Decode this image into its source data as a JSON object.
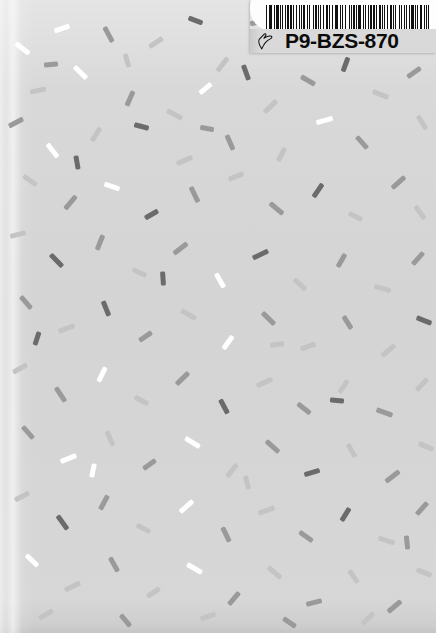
{
  "scene": {
    "width": 436,
    "height": 633,
    "background_color": "#d6d6d6",
    "description": "terrazzo-speckled light gray card with adhesive barcode label at top right"
  },
  "label": {
    "code_text": "P9-BZS-870",
    "hand_icon_name": "pointing-hand-icon",
    "barcode_name": "code128-barcode",
    "white_area_color": "#fdfdfd",
    "gray_area_color": "#d9d9d9",
    "text_color": "#0b0b0b",
    "bar_color": "#111111",
    "barcode_pattern": [
      2,
      2,
      1,
      2,
      3,
      2,
      1,
      3,
      4,
      2,
      1,
      2,
      2,
      3,
      1,
      2,
      3,
      2,
      2,
      2,
      1,
      4,
      2,
      2,
      1,
      2,
      2,
      2,
      3,
      3,
      1,
      2,
      2,
      4,
      1,
      2,
      3,
      2,
      1,
      2,
      2,
      3,
      2,
      2,
      4,
      2,
      1,
      3,
      2,
      2,
      1,
      2,
      3,
      2,
      2,
      2,
      1,
      3,
      2,
      4,
      1,
      2,
      2,
      2,
      3,
      2,
      1,
      2,
      4,
      3,
      2,
      2,
      1,
      3,
      2,
      2,
      2,
      2,
      3,
      2,
      1,
      4,
      2,
      2,
      1,
      2,
      2,
      3,
      2,
      2,
      3,
      2,
      1,
      2,
      2,
      4,
      1,
      2,
      3,
      2,
      2,
      2,
      1,
      3,
      2,
      2,
      4,
      2,
      1,
      2,
      2,
      2,
      3,
      3,
      2,
      2,
      1,
      2,
      2,
      4
    ]
  },
  "palette": {
    "fleck_white": "#ffffff",
    "fleck_light": "#c4c4c4",
    "fleck_medium": "#9a9a9a",
    "fleck_dark": "#6b6b6b",
    "fleck_darkest": "#555555",
    "paper_light": "#dadada",
    "paper_mid": "#d4d4d4"
  },
  "flecks": [
    [
      14,
      46,
      17,
      5,
      38,
      "#ffffff"
    ],
    [
      54,
      26,
      16,
      5,
      -20,
      "#ffffff"
    ],
    [
      100,
      32,
      17,
      5,
      62,
      "#9a9a9a"
    ],
    [
      148,
      40,
      16,
      5,
      -34,
      "#c4c4c4"
    ],
    [
      188,
      18,
      15,
      5,
      20,
      "#6b6b6b"
    ],
    [
      214,
      62,
      17,
      5,
      -52,
      "#c4c4c4"
    ],
    [
      30,
      88,
      16,
      5,
      -12,
      "#c4c4c4"
    ],
    [
      72,
      70,
      17,
      5,
      44,
      "#ffffff"
    ],
    [
      122,
      96,
      16,
      5,
      -66,
      "#9a9a9a"
    ],
    [
      166,
      112,
      17,
      5,
      28,
      "#c4c4c4"
    ],
    [
      198,
      86,
      15,
      5,
      -40,
      "#ffffff"
    ],
    [
      238,
      70,
      16,
      5,
      70,
      "#6b6b6b"
    ],
    [
      8,
      120,
      16,
      5,
      -28,
      "#9a9a9a"
    ],
    [
      44,
      148,
      17,
      5,
      52,
      "#ffffff"
    ],
    [
      88,
      132,
      16,
      5,
      -58,
      "#c4c4c4"
    ],
    [
      134,
      124,
      15,
      5,
      14,
      "#6b6b6b"
    ],
    [
      176,
      158,
      17,
      5,
      -24,
      "#c4c4c4"
    ],
    [
      222,
      140,
      16,
      5,
      66,
      "#9a9a9a"
    ],
    [
      262,
      104,
      17,
      5,
      -44,
      "#c4c4c4"
    ],
    [
      300,
      78,
      16,
      5,
      30,
      "#9a9a9a"
    ],
    [
      338,
      62,
      15,
      5,
      -70,
      "#6b6b6b"
    ],
    [
      372,
      92,
      17,
      5,
      22,
      "#c4c4c4"
    ],
    [
      406,
      70,
      16,
      5,
      -36,
      "#9a9a9a"
    ],
    [
      414,
      120,
      16,
      5,
      58,
      "#c4c4c4"
    ],
    [
      316,
      118,
      17,
      5,
      -16,
      "#ffffff"
    ],
    [
      354,
      140,
      16,
      5,
      48,
      "#9a9a9a"
    ],
    [
      274,
      152,
      15,
      5,
      -62,
      "#c4c4c4"
    ],
    [
      22,
      178,
      16,
      5,
      36,
      "#c4c4c4"
    ],
    [
      62,
      200,
      17,
      5,
      -50,
      "#9a9a9a"
    ],
    [
      104,
      184,
      16,
      5,
      18,
      "#ffffff"
    ],
    [
      144,
      212,
      15,
      5,
      -30,
      "#6b6b6b"
    ],
    [
      186,
      192,
      17,
      5,
      64,
      "#9a9a9a"
    ],
    [
      228,
      174,
      16,
      5,
      -22,
      "#c4c4c4"
    ],
    [
      268,
      206,
      17,
      5,
      40,
      "#9a9a9a"
    ],
    [
      310,
      188,
      16,
      5,
      -56,
      "#6b6b6b"
    ],
    [
      348,
      214,
      15,
      5,
      26,
      "#c4c4c4"
    ],
    [
      390,
      180,
      17,
      5,
      -42,
      "#9a9a9a"
    ],
    [
      412,
      210,
      16,
      5,
      54,
      "#c4c4c4"
    ],
    [
      10,
      232,
      16,
      5,
      -14,
      "#c4c4c4"
    ],
    [
      48,
      258,
      17,
      5,
      46,
      "#6b6b6b"
    ],
    [
      92,
      240,
      16,
      5,
      -68,
      "#9a9a9a"
    ],
    [
      132,
      270,
      15,
      5,
      24,
      "#c4c4c4"
    ],
    [
      172,
      246,
      17,
      5,
      -38,
      "#9a9a9a"
    ],
    [
      212,
      278,
      16,
      5,
      60,
      "#ffffff"
    ],
    [
      252,
      252,
      17,
      5,
      -26,
      "#6b6b6b"
    ],
    [
      292,
      282,
      16,
      5,
      42,
      "#c4c4c4"
    ],
    [
      334,
      258,
      15,
      5,
      -60,
      "#9a9a9a"
    ],
    [
      374,
      286,
      17,
      5,
      16,
      "#c4c4c4"
    ],
    [
      410,
      256,
      16,
      5,
      -48,
      "#9a9a9a"
    ],
    [
      18,
      300,
      16,
      5,
      50,
      "#9a9a9a"
    ],
    [
      58,
      326,
      17,
      5,
      -20,
      "#c4c4c4"
    ],
    [
      98,
      306,
      16,
      5,
      68,
      "#6b6b6b"
    ],
    [
      138,
      334,
      15,
      5,
      -34,
      "#9a9a9a"
    ],
    [
      180,
      312,
      17,
      5,
      30,
      "#c4c4c4"
    ],
    [
      220,
      340,
      16,
      5,
      -54,
      "#ffffff"
    ],
    [
      260,
      316,
      17,
      5,
      44,
      "#9a9a9a"
    ],
    [
      300,
      344,
      16,
      5,
      -18,
      "#c4c4c4"
    ],
    [
      340,
      320,
      15,
      5,
      58,
      "#9a9a9a"
    ],
    [
      380,
      348,
      17,
      5,
      -40,
      "#c4c4c4"
    ],
    [
      416,
      318,
      16,
      5,
      22,
      "#6b6b6b"
    ],
    [
      12,
      366,
      16,
      5,
      -30,
      "#c4c4c4"
    ],
    [
      52,
      392,
      17,
      5,
      56,
      "#9a9a9a"
    ],
    [
      94,
      372,
      16,
      5,
      -64,
      "#ffffff"
    ],
    [
      134,
      398,
      15,
      5,
      28,
      "#c4c4c4"
    ],
    [
      174,
      376,
      17,
      5,
      -44,
      "#9a9a9a"
    ],
    [
      216,
      404,
      16,
      5,
      62,
      "#6b6b6b"
    ],
    [
      256,
      380,
      17,
      5,
      -24,
      "#c4c4c4"
    ],
    [
      296,
      406,
      16,
      5,
      38,
      "#9a9a9a"
    ],
    [
      336,
      384,
      15,
      5,
      -56,
      "#c4c4c4"
    ],
    [
      376,
      410,
      17,
      5,
      20,
      "#9a9a9a"
    ],
    [
      414,
      382,
      16,
      5,
      -46,
      "#c4c4c4"
    ],
    [
      20,
      430,
      16,
      5,
      48,
      "#9a9a9a"
    ],
    [
      60,
      456,
      17,
      5,
      -22,
      "#ffffff"
    ],
    [
      102,
      436,
      16,
      5,
      66,
      "#c4c4c4"
    ],
    [
      142,
      462,
      15,
      5,
      -36,
      "#9a9a9a"
    ],
    [
      184,
      440,
      17,
      5,
      32,
      "#ffffff"
    ],
    [
      224,
      468,
      16,
      5,
      -52,
      "#c4c4c4"
    ],
    [
      264,
      444,
      17,
      5,
      42,
      "#9a9a9a"
    ],
    [
      304,
      470,
      16,
      5,
      -16,
      "#6b6b6b"
    ],
    [
      344,
      448,
      15,
      5,
      60,
      "#c4c4c4"
    ],
    [
      384,
      474,
      17,
      5,
      -38,
      "#9a9a9a"
    ],
    [
      418,
      444,
      16,
      5,
      24,
      "#c4c4c4"
    ],
    [
      14,
      494,
      16,
      5,
      -28,
      "#c4c4c4"
    ],
    [
      54,
      520,
      17,
      5,
      54,
      "#6b6b6b"
    ],
    [
      96,
      500,
      16,
      5,
      -62,
      "#9a9a9a"
    ],
    [
      136,
      526,
      15,
      5,
      26,
      "#c4c4c4"
    ],
    [
      178,
      504,
      17,
      5,
      -42,
      "#ffffff"
    ],
    [
      218,
      532,
      16,
      5,
      64,
      "#9a9a9a"
    ],
    [
      258,
      508,
      17,
      5,
      -20,
      "#c4c4c4"
    ],
    [
      298,
      534,
      16,
      5,
      36,
      "#9a9a9a"
    ],
    [
      338,
      512,
      15,
      5,
      -58,
      "#6b6b6b"
    ],
    [
      378,
      538,
      17,
      5,
      18,
      "#c4c4c4"
    ],
    [
      414,
      506,
      16,
      5,
      -48,
      "#9a9a9a"
    ],
    [
      24,
      558,
      16,
      5,
      44,
      "#ffffff"
    ],
    [
      64,
      584,
      17,
      5,
      -26,
      "#c4c4c4"
    ],
    [
      106,
      562,
      16,
      5,
      60,
      "#9a9a9a"
    ],
    [
      146,
      590,
      15,
      5,
      -34,
      "#c4c4c4"
    ],
    [
      186,
      566,
      17,
      5,
      30,
      "#ffffff"
    ],
    [
      226,
      596,
      16,
      5,
      -50,
      "#9a9a9a"
    ],
    [
      266,
      570,
      17,
      5,
      40,
      "#c4c4c4"
    ],
    [
      306,
      600,
      16,
      5,
      -14,
      "#9a9a9a"
    ],
    [
      346,
      574,
      15,
      5,
      56,
      "#c4c4c4"
    ],
    [
      386,
      604,
      17,
      5,
      -40,
      "#9a9a9a"
    ],
    [
      416,
      570,
      16,
      5,
      22,
      "#c4c4c4"
    ],
    [
      38,
      612,
      16,
      5,
      -30,
      "#c4c4c4"
    ],
    [
      118,
      618,
      15,
      5,
      50,
      "#9a9a9a"
    ],
    [
      200,
      614,
      16,
      5,
      -20,
      "#c4c4c4"
    ],
    [
      282,
      620,
      15,
      5,
      34,
      "#9a9a9a"
    ],
    [
      360,
      616,
      16,
      5,
      -44,
      "#c4c4c4"
    ],
    [
      70,
      160,
      14,
      5,
      80,
      "#6b6b6b"
    ],
    [
      250,
      20,
      14,
      5,
      -10,
      "#9a9a9a"
    ],
    [
      120,
      58,
      14,
      5,
      74,
      "#c4c4c4"
    ],
    [
      30,
      336,
      14,
      5,
      -72,
      "#6b6b6b"
    ],
    [
      200,
      126,
      14,
      5,
      10,
      "#9a9a9a"
    ],
    [
      270,
      342,
      14,
      5,
      -8,
      "#c4c4c4"
    ],
    [
      156,
      276,
      14,
      5,
      86,
      "#6b6b6b"
    ],
    [
      86,
      468,
      14,
      5,
      -78,
      "#ffffff"
    ],
    [
      330,
      398,
      14,
      5,
      6,
      "#6b6b6b"
    ],
    [
      240,
      480,
      14,
      5,
      76,
      "#c4c4c4"
    ],
    [
      44,
      62,
      14,
      5,
      -6,
      "#9a9a9a"
    ],
    [
      400,
      540,
      14,
      5,
      84,
      "#9a9a9a"
    ]
  ]
}
